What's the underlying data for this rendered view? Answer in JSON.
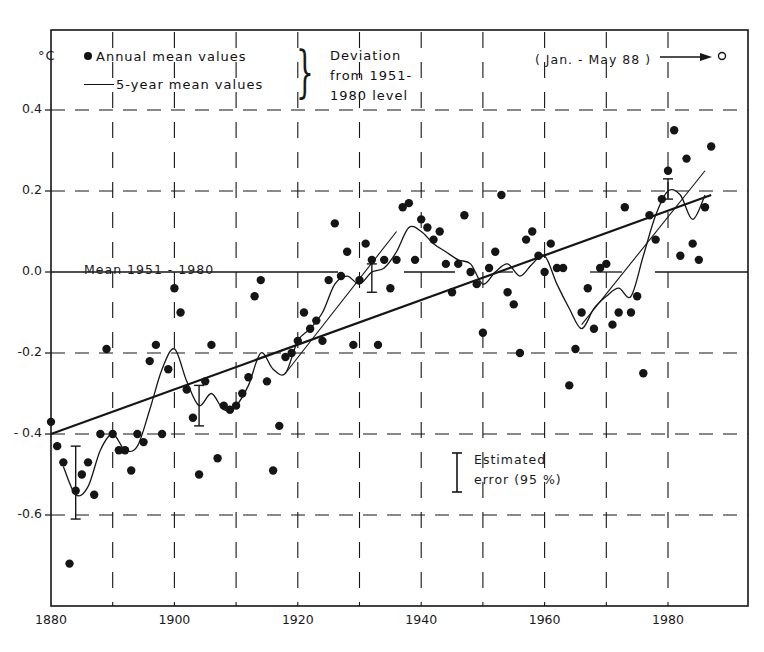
{
  "chart_data": {
    "type": "scatter",
    "title": "",
    "xlabel": "",
    "ylabel": "°C",
    "xlim": [
      1880,
      1989
    ],
    "ylim": [
      -0.75,
      0.42
    ],
    "x_ticks": [
      1880,
      1900,
      1920,
      1940,
      1960,
      1980
    ],
    "y_ticks": [
      0.4,
      0.2,
      0.0,
      -0.2,
      -0.4,
      -0.6
    ],
    "y_tick_labels": [
      "0.4",
      "0.2",
      "0.0",
      "-0.2",
      "- 0.4",
      "-0.6"
    ],
    "x_tick_labels": [
      "1880",
      "1900",
      "1920",
      "1940",
      "1960",
      "1980"
    ],
    "grid": "dashed",
    "legend": {
      "position": "top-left",
      "entries": [
        "Annual mean values",
        "5-year mean values"
      ],
      "bracket_note": [
        "Deviation",
        "from 1951-",
        "1980 level"
      ]
    },
    "annotations": {
      "mean_line_label": "Mean 1951 - 1980",
      "jan_may_note": "( Jan. - May 88 )",
      "jan_may_value": 0.4,
      "error_label_line1": "Estimated",
      "error_label_line2": "error (95 %)"
    },
    "series": [
      {
        "name": "Annual mean values",
        "kind": "points",
        "x": [
          1880,
          1881,
          1882,
          1883,
          1884,
          1885,
          1886,
          1887,
          1888,
          1889,
          1890,
          1891,
          1892,
          1893,
          1894,
          1895,
          1896,
          1897,
          1898,
          1899,
          1900,
          1901,
          1902,
          1903,
          1904,
          1905,
          1906,
          1907,
          1908,
          1909,
          1910,
          1911,
          1912,
          1913,
          1914,
          1915,
          1916,
          1917,
          1918,
          1919,
          1920,
          1921,
          1922,
          1923,
          1924,
          1925,
          1926,
          1927,
          1928,
          1929,
          1930,
          1931,
          1932,
          1933,
          1934,
          1935,
          1936,
          1937,
          1938,
          1939,
          1940,
          1941,
          1942,
          1943,
          1944,
          1945,
          1946,
          1947,
          1948,
          1949,
          1950,
          1951,
          1952,
          1953,
          1954,
          1955,
          1956,
          1957,
          1958,
          1959,
          1960,
          1961,
          1962,
          1963,
          1964,
          1965,
          1966,
          1967,
          1968,
          1969,
          1970,
          1971,
          1972,
          1973,
          1974,
          1975,
          1976,
          1977,
          1978,
          1979,
          1980,
          1981,
          1982,
          1983,
          1984,
          1985,
          1986,
          1987
        ],
        "values": [
          -0.37,
          -0.43,
          -0.47,
          -0.72,
          -0.54,
          -0.5,
          -0.47,
          -0.55,
          -0.4,
          -0.19,
          -0.4,
          -0.44,
          -0.44,
          -0.49,
          -0.4,
          -0.42,
          -0.22,
          -0.18,
          -0.4,
          -0.24,
          -0.04,
          -0.1,
          -0.29,
          -0.36,
          -0.5,
          -0.27,
          -0.18,
          -0.46,
          -0.33,
          -0.34,
          -0.33,
          -0.3,
          -0.26,
          -0.06,
          -0.02,
          -0.27,
          -0.49,
          -0.38,
          -0.21,
          -0.2,
          -0.17,
          -0.1,
          -0.14,
          -0.12,
          -0.17,
          -0.02,
          0.12,
          -0.01,
          0.05,
          -0.18,
          -0.02,
          0.07,
          0.03,
          -0.18,
          0.03,
          -0.04,
          0.03,
          0.16,
          0.17,
          0.03,
          0.13,
          0.11,
          0.08,
          0.1,
          0.02,
          -0.05,
          0.02,
          0.14,
          0.0,
          -0.03,
          -0.15,
          0.01,
          0.05,
          0.19,
          -0.05,
          -0.08,
          -0.2,
          0.08,
          0.1,
          0.04,
          0.0,
          0.07,
          0.01,
          0.01,
          -0.28,
          -0.19,
          -0.1,
          -0.04,
          -0.14,
          0.01,
          0.02,
          -0.13,
          -0.1,
          0.16,
          -0.1,
          -0.06,
          -0.25,
          0.14,
          0.08,
          0.18,
          0.25,
          0.35,
          0.04,
          0.28,
          0.07,
          0.03,
          0.16,
          0.31
        ]
      },
      {
        "name": "5-year mean values",
        "kind": "smooth-line",
        "x": [
          1882,
          1884,
          1886,
          1888,
          1890,
          1892,
          1894,
          1896,
          1898,
          1900,
          1902,
          1904,
          1906,
          1908,
          1910,
          1912,
          1914,
          1916,
          1918,
          1920,
          1922,
          1924,
          1926,
          1928,
          1930,
          1932,
          1934,
          1936,
          1938,
          1940,
          1942,
          1944,
          1946,
          1948,
          1950,
          1952,
          1954,
          1956,
          1958,
          1960,
          1962,
          1964,
          1966,
          1968,
          1970,
          1972,
          1974,
          1976,
          1978,
          1980,
          1982,
          1984,
          1986
        ],
        "values": [
          -0.48,
          -0.55,
          -0.53,
          -0.44,
          -0.4,
          -0.44,
          -0.43,
          -0.34,
          -0.24,
          -0.19,
          -0.27,
          -0.33,
          -0.3,
          -0.34,
          -0.33,
          -0.28,
          -0.2,
          -0.24,
          -0.25,
          -0.17,
          -0.14,
          -0.1,
          -0.03,
          -0.01,
          -0.03,
          0.0,
          0.01,
          0.05,
          0.11,
          0.1,
          0.07,
          0.05,
          0.03,
          0.02,
          -0.03,
          0.0,
          0.02,
          -0.01,
          0.02,
          0.04,
          -0.03,
          -0.09,
          -0.14,
          -0.09,
          -0.06,
          -0.04,
          -0.06,
          0.04,
          0.14,
          0.2,
          0.19,
          0.13,
          0.19
        ]
      },
      {
        "name": "Linear trend",
        "kind": "line",
        "x": [
          1880,
          1987
        ],
        "values": [
          -0.4,
          0.19
        ]
      }
    ],
    "secondary_trends": [
      {
        "x": [
          1918,
          1936
        ],
        "values": [
          -0.25,
          0.1
        ]
      },
      {
        "x": [
          1966,
          1986
        ],
        "values": [
          -0.13,
          0.25
        ]
      }
    ],
    "error_bars": [
      {
        "x": 1884,
        "low": -0.61,
        "high": -0.43
      },
      {
        "x": 1904,
        "low": -0.38,
        "high": -0.28
      },
      {
        "x": 1932,
        "low": -0.05,
        "high": 0.02
      },
      {
        "x": 1980,
        "low": 0.18,
        "high": 0.23
      }
    ]
  },
  "labels": {
    "unit": "°C",
    "legend_annual": "Annual mean values",
    "legend_5yr": "5-year mean values",
    "deviation_1": "Deviation",
    "deviation_2": "from 1951-",
    "deviation_3": "1980 level",
    "brace": "}",
    "jan_may": "( Jan. - May 88 )",
    "mean_label": "Mean 1951 - 1980",
    "error_1": "Estimated",
    "error_2": "error (95 %)"
  }
}
